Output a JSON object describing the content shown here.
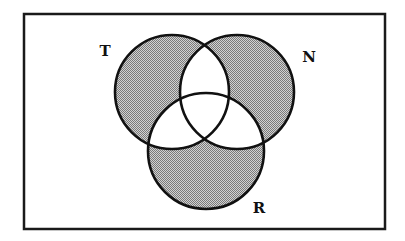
{
  "diagram": {
    "type": "venn",
    "universe": {
      "frame": {
        "x": 24,
        "y": 14,
        "width": 361,
        "height": 215
      },
      "border_color": "#1a1a1a"
    },
    "sets": [
      {
        "id": "T",
        "label": "T",
        "cx": 172,
        "cy": 92,
        "r": 57,
        "label_pos": {
          "x": 105,
          "y": 56
        }
      },
      {
        "id": "N",
        "label": "N",
        "cx": 237,
        "cy": 92,
        "r": 57,
        "label_pos": {
          "x": 309,
          "y": 62
        }
      },
      {
        "id": "R",
        "label": "R",
        "cx": 206,
        "cy": 151,
        "r": 58,
        "label_pos": {
          "x": 259,
          "y": 213
        }
      }
    ],
    "shaded_regions": [
      "T only",
      "N only",
      "R only"
    ],
    "unshaded_regions": [
      "T∩N only",
      "T∩R only",
      "N∩R only",
      "T∩N∩R",
      "outside all sets"
    ],
    "colors": {
      "shade_dark": "#7a7a7a",
      "shade_light": "#d2d2d2",
      "stroke": "#111111",
      "background": "#ffffff"
    }
  }
}
